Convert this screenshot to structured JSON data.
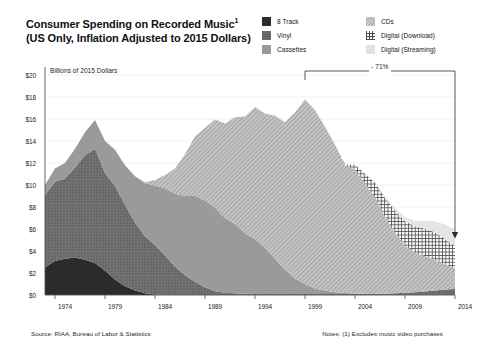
{
  "title": {
    "line1": "Consumer Spending on Recorded Music",
    "line1_sup": "1",
    "line2": "(US Only, Inflation Adjusted to 2015 Dollars)"
  },
  "legend": {
    "items": [
      {
        "label": "8 Track",
        "key": "8track",
        "color": "#2b2b2b",
        "pattern": "solid-dark"
      },
      {
        "label": "Vinyl",
        "key": "vinyl",
        "color": "#6f6f6f",
        "pattern": "dotted"
      },
      {
        "label": "Cassettes",
        "key": "cassettes",
        "color": "#9a9a9a",
        "pattern": "solid-mid"
      },
      {
        "label": "CDs",
        "key": "cds",
        "color": "#c9c9c9",
        "pattern": "diagonal-hatch"
      },
      {
        "label": "Digital (Download)",
        "key": "download",
        "color": "#ffffff",
        "pattern": "crosshatch"
      },
      {
        "label": "Digital (Streaming)",
        "key": "streaming",
        "color": "#e2e2e2",
        "pattern": "solid-light"
      }
    ]
  },
  "axis_title": "Billions of 2015 Dollars",
  "annotation": {
    "label": "- 71%",
    "from_year": 1999,
    "to_year": 2014
  },
  "footer": {
    "source": "Source: RIAA, Bureau of Labor & Statistics",
    "notes": "Notes: (1) Excludes music video purchases"
  },
  "chart_data": {
    "type": "area",
    "stacked": true,
    "xlabel": "",
    "ylabel": "Billions of 2015 Dollars",
    "xlim": [
      1973,
      2014
    ],
    "ylim": [
      0,
      20
    ],
    "yticks": [
      0,
      2,
      4,
      6,
      8,
      10,
      12,
      14,
      16,
      18,
      20
    ],
    "ytick_labels": [
      "$0",
      "$2",
      "$4",
      "$6",
      "$8",
      "$10",
      "$12",
      "$14",
      "$16",
      "$18",
      "$20"
    ],
    "xticks": [
      1974,
      1979,
      1984,
      1989,
      1994,
      1999,
      2004,
      2009,
      2014
    ],
    "xtick_labels": [
      "1974",
      "1979",
      "1984",
      "1989",
      "1994",
      "1999",
      "2004",
      "2009",
      "2014"
    ],
    "grid": true,
    "legend_position": "top-right",
    "x": [
      1973,
      1974,
      1975,
      1976,
      1977,
      1978,
      1979,
      1980,
      1981,
      1982,
      1983,
      1984,
      1985,
      1986,
      1987,
      1988,
      1989,
      1990,
      1991,
      1992,
      1993,
      1994,
      1995,
      1996,
      1997,
      1998,
      1999,
      2000,
      2001,
      2002,
      2003,
      2004,
      2005,
      2006,
      2007,
      2008,
      2009,
      2010,
      2011,
      2012,
      2013,
      2014
    ],
    "series": [
      {
        "name": "8 Track",
        "values": [
          2.5,
          3.1,
          3.3,
          3.4,
          3.2,
          2.9,
          2.2,
          1.4,
          0.8,
          0.4,
          0.15,
          0.05,
          0,
          0,
          0,
          0,
          0,
          0,
          0,
          0,
          0,
          0,
          0,
          0,
          0,
          0,
          0,
          0,
          0,
          0,
          0,
          0,
          0,
          0,
          0,
          0,
          0,
          0,
          0,
          0,
          0,
          0
        ]
      },
      {
        "name": "Vinyl",
        "values": [
          6.6,
          7.2,
          7.3,
          8.2,
          9.5,
          10.4,
          8.9,
          8.5,
          7.4,
          6.2,
          5.2,
          4.5,
          3.6,
          2.6,
          1.8,
          1.2,
          0.7,
          0.35,
          0.2,
          0.15,
          0.12,
          0.1,
          0.1,
          0.1,
          0.1,
          0.1,
          0.1,
          0.1,
          0.1,
          0.1,
          0.1,
          0.1,
          0.1,
          0.1,
          0.12,
          0.15,
          0.2,
          0.25,
          0.32,
          0.4,
          0.5,
          0.55
        ]
      },
      {
        "name": "Cassettes",
        "values": [
          0.9,
          1.2,
          1.4,
          1.7,
          2.1,
          2.6,
          2.9,
          3.3,
          3.6,
          4.2,
          4.8,
          5.4,
          6.1,
          6.6,
          7.2,
          7.8,
          7.9,
          7.6,
          6.8,
          6.3,
          5.5,
          5.0,
          4.2,
          3.2,
          2.2,
          1.4,
          0.9,
          0.5,
          0.3,
          0.15,
          0.08,
          0.04,
          0.02,
          0,
          0,
          0,
          0,
          0,
          0,
          0,
          0,
          0
        ]
      },
      {
        "name": "CDs",
        "values": [
          0,
          0,
          0,
          0,
          0,
          0,
          0,
          0,
          0,
          0,
          0.1,
          0.5,
          1.2,
          2.3,
          3.8,
          5.4,
          6.6,
          8.0,
          8.6,
          9.7,
          10.6,
          12.0,
          12.2,
          13.0,
          13.4,
          15.1,
          16.8,
          16.2,
          14.9,
          13.4,
          11.6,
          11.3,
          10.0,
          8.8,
          7.0,
          5.5,
          4.3,
          3.6,
          3.2,
          2.8,
          2.3,
          1.9
        ]
      },
      {
        "name": "Digital (Download)",
        "values": [
          0,
          0,
          0,
          0,
          0,
          0,
          0,
          0,
          0,
          0,
          0,
          0,
          0,
          0,
          0,
          0,
          0,
          0,
          0,
          0,
          0,
          0,
          0,
          0,
          0,
          0,
          0,
          0,
          0,
          0,
          0.1,
          0.4,
          0.9,
          1.3,
          1.7,
          2.0,
          2.2,
          2.4,
          2.5,
          2.5,
          2.3,
          2.0
        ]
      },
      {
        "name": "Digital (Streaming)",
        "values": [
          0,
          0,
          0,
          0,
          0,
          0,
          0,
          0,
          0,
          0,
          0,
          0,
          0,
          0,
          0,
          0,
          0,
          0,
          0,
          0,
          0,
          0,
          0,
          0,
          0,
          0,
          0,
          0,
          0,
          0,
          0,
          0,
          0.05,
          0.1,
          0.15,
          0.25,
          0.35,
          0.5,
          0.7,
          1.0,
          1.3,
          1.5
        ]
      }
    ],
    "totals": [
      10.0,
      11.5,
      12.0,
      13.3,
      14.8,
      15.9,
      14.0,
      13.2,
      11.8,
      10.8,
      10.25,
      10.45,
      10.9,
      11.5,
      12.8,
      14.4,
      15.2,
      15.95,
      15.6,
      16.15,
      16.22,
      17.1,
      16.5,
      16.3,
      15.7,
      16.6,
      17.8,
      16.8,
      15.3,
      13.65,
      11.88,
      11.84,
      11.07,
      10.3,
      8.97,
      7.9,
      7.05,
      6.75,
      6.72,
      6.7,
      6.4,
      5.95
    ],
    "annotations": [
      {
        "text": "- 71%",
        "from_year": 1999,
        "to_year": 2014
      }
    ]
  }
}
